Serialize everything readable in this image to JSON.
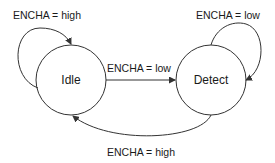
{
  "diagram": {
    "type": "state-machine",
    "states": [
      {
        "id": "idle",
        "label": "Idle"
      },
      {
        "id": "detect",
        "label": "Detect"
      }
    ],
    "transitions": [
      {
        "from": "idle",
        "to": "idle",
        "label": "ENCHA = high"
      },
      {
        "from": "idle",
        "to": "detect",
        "label": "ENCHA = low"
      },
      {
        "from": "detect",
        "to": "detect",
        "label": "ENCHA = low"
      },
      {
        "from": "detect",
        "to": "idle",
        "label": "ENCHA = high"
      }
    ],
    "colors": {
      "line": "#333333",
      "text": "#1a1a1a",
      "background": "#ffffff"
    }
  }
}
